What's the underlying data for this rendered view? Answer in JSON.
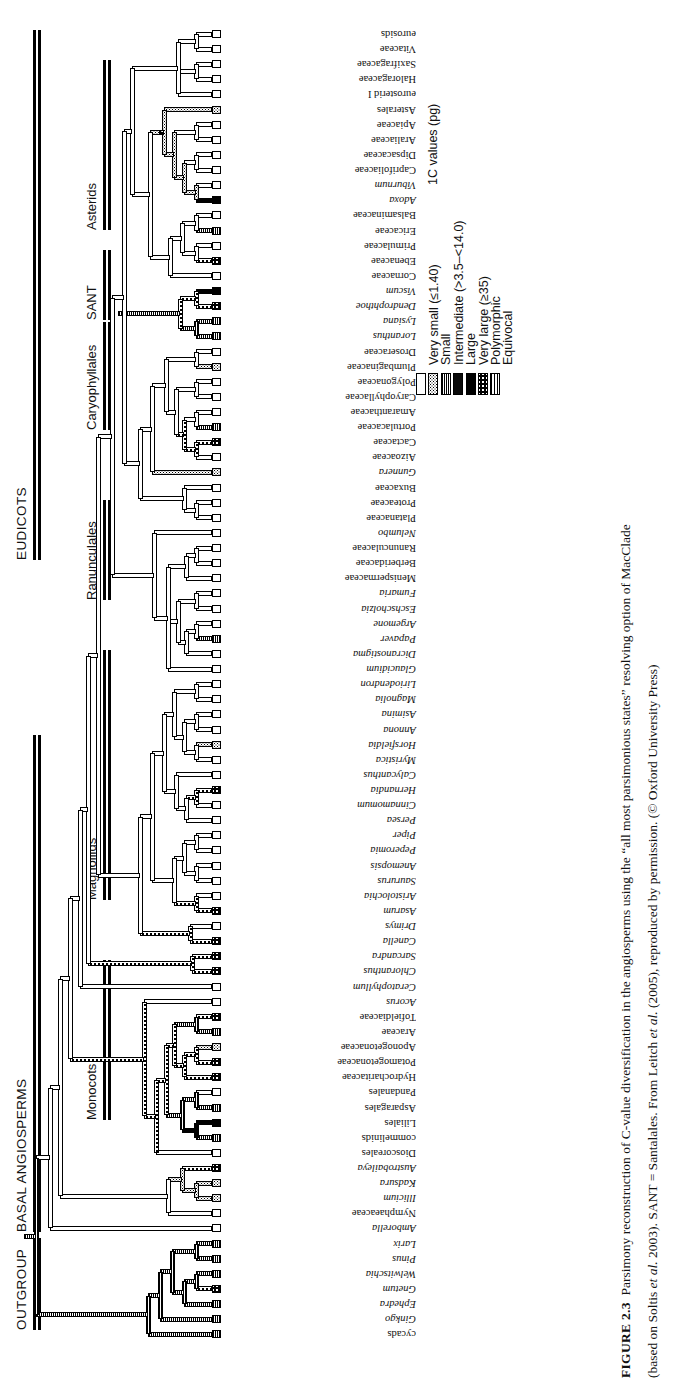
{
  "figure": {
    "number": "FIGURE 2.3",
    "caption_line1_a": "Parsimony reconstruction of C-value diversification in the angiosperms using the “all most parsimonious states” resolving option of MacClade",
    "caption_line2_a": "(based on Soltis ",
    "caption_line2_i": "et al.",
    "caption_line2_b": " 2003). SANT = Santalales. From Leitch ",
    "caption_line2_i2": "et al.",
    "caption_line2_c": " (2005), reproduced by permission. (© Oxford University Press)"
  },
  "legend": {
    "title": "1C values (pg)",
    "items": [
      {
        "label": "Very small (≤1.40)",
        "state": "vsmall"
      },
      {
        "label": "Small",
        "state": "small"
      },
      {
        "label": "Intermediate (>3.5–<14.0)",
        "state": "inter"
      },
      {
        "label": "Large",
        "state": "large"
      },
      {
        "label": "Very large (≥35)",
        "state": "vlarge"
      },
      {
        "label": "Polymorphic",
        "state": "poly"
      },
      {
        "label": "Equivocal",
        "state": "equiv"
      }
    ]
  },
  "major_groups": [
    {
      "label": "OUTGROUP",
      "start": 1238,
      "end": 1330
    },
    {
      "label": "BASAL ANGIOSPERMS",
      "start": 735,
      "end": 1232
    },
    {
      "label": "EUDICOTS",
      "start": 30,
      "end": 560
    }
  ],
  "clade_groups": [
    {
      "label": "Asterids",
      "start": 60,
      "end": 230
    },
    {
      "label": "SANT",
      "start": 250,
      "end": 320
    },
    {
      "label": "Caryophyllales",
      "start": 322,
      "end": 430
    },
    {
      "label": "Ranunculales",
      "start": 500,
      "end": 600
    },
    {
      "label": "Magnoliids",
      "start": 650,
      "end": 900
    },
    {
      "label": "Monocots",
      "start": 960,
      "end": 1120
    }
  ],
  "taxa": [
    {
      "name": "eurosids",
      "italic": false,
      "state": "vsmall"
    },
    {
      "name": "Vitaceae",
      "italic": false,
      "state": "vsmall"
    },
    {
      "name": "Saxifragaceae",
      "italic": false,
      "state": "vsmall"
    },
    {
      "name": "Haloragaceae",
      "italic": false,
      "state": "vsmall"
    },
    {
      "name": "eurosterid I",
      "italic": false,
      "state": "vsmall"
    },
    {
      "name": "Asterales",
      "italic": false,
      "state": "small"
    },
    {
      "name": "Apiaceae",
      "italic": false,
      "state": "vsmall"
    },
    {
      "name": "Araliaceae",
      "italic": false,
      "state": "vsmall"
    },
    {
      "name": "Dipsacaceae",
      "italic": false,
      "state": "vsmall"
    },
    {
      "name": "Caprifoliaceae",
      "italic": false,
      "state": "vsmall"
    },
    {
      "name": "Viburnum",
      "italic": true,
      "state": "vsmall"
    },
    {
      "name": "Adoxa",
      "italic": true,
      "state": "vlarge"
    },
    {
      "name": "Balsaminaceae",
      "italic": false,
      "state": "vsmall"
    },
    {
      "name": "Ericaceae",
      "italic": false,
      "state": "inter"
    },
    {
      "name": "Primulaceae",
      "italic": false,
      "state": "vsmall"
    },
    {
      "name": "Ebenaceae",
      "italic": false,
      "state": "poly"
    },
    {
      "name": "Cornaceae",
      "italic": false,
      "state": "vsmall"
    },
    {
      "name": "Viscum",
      "italic": true,
      "state": "vlarge"
    },
    {
      "name": "Dendrophthoe",
      "italic": true,
      "state": "poly"
    },
    {
      "name": "Lysiana",
      "italic": true,
      "state": "inter"
    },
    {
      "name": "Loranthus",
      "italic": true,
      "state": "inter"
    },
    {
      "name": "Droseraceae",
      "italic": false,
      "state": "vsmall"
    },
    {
      "name": "Plumbaginaceae",
      "italic": false,
      "state": "small"
    },
    {
      "name": "Polygonaceae",
      "italic": false,
      "state": "vsmall"
    },
    {
      "name": "Caryophyllaceae",
      "italic": false,
      "state": "vsmall"
    },
    {
      "name": "Amaranthaceae",
      "italic": false,
      "state": "vsmall"
    },
    {
      "name": "Portulacaceae",
      "italic": false,
      "state": "inter"
    },
    {
      "name": "Cactaceae",
      "italic": false,
      "state": "poly"
    },
    {
      "name": "Aizoaceae",
      "italic": false,
      "state": "vsmall"
    },
    {
      "name": "Gunnera",
      "italic": true,
      "state": "small"
    },
    {
      "name": "Buxaceae",
      "italic": false,
      "state": "vsmall"
    },
    {
      "name": "Proteaceae",
      "italic": false,
      "state": "vsmall"
    },
    {
      "name": "Platanaceae",
      "italic": false,
      "state": "vsmall"
    },
    {
      "name": "Nelumbo",
      "italic": true,
      "state": "vsmall"
    },
    {
      "name": "Ranunculaceae",
      "italic": false,
      "state": "vsmall"
    },
    {
      "name": "Berberidaceae",
      "italic": false,
      "state": "vsmall"
    },
    {
      "name": "Menispermaceae",
      "italic": false,
      "state": "vsmall"
    },
    {
      "name": "Fumaria",
      "italic": true,
      "state": "vsmall"
    },
    {
      "name": "Eschscholzia",
      "italic": true,
      "state": "vsmall"
    },
    {
      "name": "Argemone",
      "italic": true,
      "state": "vsmall"
    },
    {
      "name": "Papaver",
      "italic": true,
      "state": "inter"
    },
    {
      "name": "Dicranostigma",
      "italic": true,
      "state": "vsmall"
    },
    {
      "name": "Glaucidium",
      "italic": true,
      "state": "vsmall"
    },
    {
      "name": "Liriodendron",
      "italic": true,
      "state": "vsmall"
    },
    {
      "name": "Magnolia",
      "italic": true,
      "state": "vsmall"
    },
    {
      "name": "Asimina",
      "italic": true,
      "state": "vsmall"
    },
    {
      "name": "Annona",
      "italic": true,
      "state": "vsmall"
    },
    {
      "name": "Horsfieldia",
      "italic": true,
      "state": "small"
    },
    {
      "name": "Myristica",
      "italic": true,
      "state": "vsmall"
    },
    {
      "name": "Calycanthus",
      "italic": true,
      "state": "vsmall"
    },
    {
      "name": "Hernandia",
      "italic": true,
      "state": "poly"
    },
    {
      "name": "Cinnamomum",
      "italic": true,
      "state": "vsmall"
    },
    {
      "name": "Persea",
      "italic": true,
      "state": "vsmall"
    },
    {
      "name": "Piper",
      "italic": true,
      "state": "vsmall"
    },
    {
      "name": "Peperomia",
      "italic": true,
      "state": "vsmall"
    },
    {
      "name": "Anemopsis",
      "italic": true,
      "state": "vsmall"
    },
    {
      "name": "Saururus",
      "italic": true,
      "state": "vsmall"
    },
    {
      "name": "Aristolochia",
      "italic": true,
      "state": "vsmall"
    },
    {
      "name": "Asarum",
      "italic": true,
      "state": "poly"
    },
    {
      "name": "Drimys",
      "italic": true,
      "state": "vsmall"
    },
    {
      "name": "Canella",
      "italic": true,
      "state": "poly"
    },
    {
      "name": "Sarcandra",
      "italic": true,
      "state": "poly"
    },
    {
      "name": "Chloranthus",
      "italic": true,
      "state": "poly"
    },
    {
      "name": "Ceratophyllum",
      "italic": true,
      "state": "vsmall"
    },
    {
      "name": "Acorus",
      "italic": true,
      "state": "vsmall"
    },
    {
      "name": "Tofieldiaceae",
      "italic": false,
      "state": "poly"
    },
    {
      "name": "Araceae",
      "italic": false,
      "state": "inter"
    },
    {
      "name": "Aponogetonaceae",
      "italic": false,
      "state": "small"
    },
    {
      "name": "Potamogetonaceae",
      "italic": false,
      "state": "poly"
    },
    {
      "name": "Hydrocharitaceae",
      "italic": false,
      "state": "poly"
    },
    {
      "name": "Pandanales",
      "italic": false,
      "state": "vsmall"
    },
    {
      "name": "Asparagales",
      "italic": false,
      "state": "inter"
    },
    {
      "name": "Liliales",
      "italic": false,
      "state": "vlarge"
    },
    {
      "name": "commelinids",
      "italic": false,
      "state": "inter"
    },
    {
      "name": "Dioscoreales",
      "italic": false,
      "state": "vsmall"
    },
    {
      "name": "Austrobaileya",
      "italic": true,
      "state": "poly"
    },
    {
      "name": "Kadsura",
      "italic": true,
      "state": "small"
    },
    {
      "name": "Illicium",
      "italic": true,
      "state": "small"
    },
    {
      "name": "Nymphaeaceae",
      "italic": false,
      "state": "vsmall"
    },
    {
      "name": "Amborella",
      "italic": true,
      "state": "vsmall"
    },
    {
      "name": "Larix",
      "italic": true,
      "state": "inter"
    },
    {
      "name": "Pinus",
      "italic": true,
      "state": "inter"
    },
    {
      "name": "Welwitschia",
      "italic": true,
      "state": "inter"
    },
    {
      "name": "Gnetum",
      "italic": true,
      "state": "poly"
    },
    {
      "name": "Ephedra",
      "italic": true,
      "state": "inter"
    },
    {
      "name": "Ginkgo",
      "italic": true,
      "state": "inter"
    },
    {
      "name": "cycads",
      "italic": false,
      "state": "inter"
    }
  ]
}
